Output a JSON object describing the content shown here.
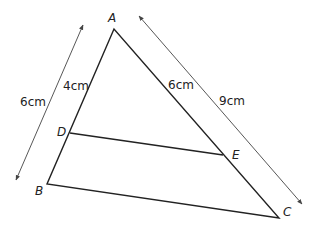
{
  "diagram": {
    "type": "similar-triangles",
    "points": {
      "A": {
        "label": "A",
        "x": 114,
        "y": 29
      },
      "B": {
        "label": "B",
        "x": 47,
        "y": 184
      },
      "C": {
        "label": "C",
        "x": 279,
        "y": 218
      },
      "D": {
        "label": "D",
        "x": 70,
        "y": 133
      },
      "E": {
        "label": "E",
        "x": 223,
        "y": 155
      }
    },
    "measurements": {
      "AD": "4cm",
      "AB": "6cm",
      "AE": "6cm",
      "AC": "9cm"
    },
    "line_color": "#222222",
    "arrow_color": "#444444"
  }
}
